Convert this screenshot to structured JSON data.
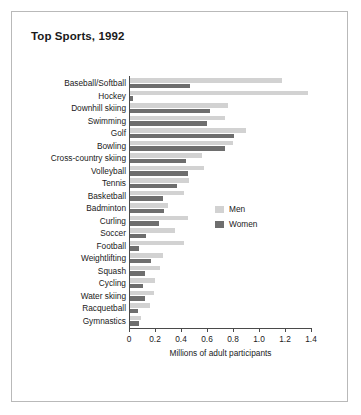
{
  "chart_data": {
    "type": "bar",
    "orientation": "horizontal",
    "title": "Top Sports, 1992",
    "xlabel": "Millions of adult participants",
    "ylabel": "",
    "xlim": [
      0,
      1.4
    ],
    "xticks": [
      0,
      0.2,
      0.4,
      0.6,
      0.8,
      1.0,
      1.2,
      1.4
    ],
    "xtick_labels": [
      "0",
      "0.2",
      "0.4",
      "0.6",
      "0.8",
      "1.0",
      "1.2",
      "1.4"
    ],
    "grid": false,
    "legend_position": "center-right",
    "categories": [
      "Baseball/Softball",
      "Hockey",
      "Downhill skiing",
      "Swimming",
      "Golf",
      "Bowling",
      "Cross-country skiing",
      "Volleyball",
      "Tennis",
      "Basketball",
      "Badminton",
      "Curling",
      "Soccer",
      "Football",
      "Weightlifting",
      "Squash",
      "Cycling",
      "Water skiing",
      "Racquetball",
      "Gymnastics"
    ],
    "series": [
      {
        "name": "Men",
        "color": "#d2d2d2",
        "values": [
          1.18,
          1.38,
          0.76,
          0.74,
          0.9,
          0.8,
          0.56,
          0.58,
          0.46,
          0.42,
          0.3,
          0.45,
          0.35,
          0.42,
          0.26,
          0.24,
          0.2,
          0.19,
          0.16,
          0.09
        ]
      },
      {
        "name": "Women",
        "color": "#6e6e6e",
        "values": [
          0.47,
          0.03,
          0.62,
          0.6,
          0.81,
          0.74,
          0.44,
          0.45,
          0.37,
          0.26,
          0.27,
          0.23,
          0.13,
          0.08,
          0.17,
          0.12,
          0.11,
          0.12,
          0.07,
          0.08
        ]
      }
    ]
  },
  "legend": {
    "items": [
      {
        "label": "Men"
      },
      {
        "label": "Women"
      }
    ]
  },
  "colors": {
    "men": "#d2d2d2",
    "women": "#6e6e6e",
    "axis": "#4a4a4a",
    "frame": "#b9b9b9",
    "text": "#1a1a1a"
  }
}
